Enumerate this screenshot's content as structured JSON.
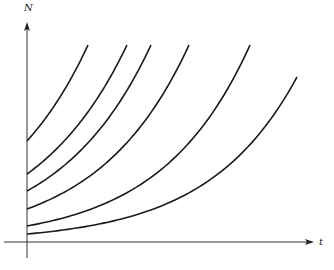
{
  "axes": {
    "y_label": "N",
    "x_label": "t",
    "origin": [
      27,
      242
    ],
    "x_end": 314,
    "y_top": 22
  },
  "chart_data": {
    "type": "line",
    "title": "",
    "xlabel": "t",
    "ylabel": "N",
    "grid": false,
    "series": [
      {
        "name": "curve-1",
        "start": [
          27,
          141
        ],
        "end": [
          88,
          45
        ]
      },
      {
        "name": "curve-2",
        "start": [
          27,
          174
        ],
        "end": [
          127,
          45
        ]
      },
      {
        "name": "curve-3",
        "start": [
          27,
          191
        ],
        "end": [
          151,
          45
        ]
      },
      {
        "name": "curve-4",
        "start": [
          27,
          209
        ],
        "end": [
          189,
          45
        ]
      },
      {
        "name": "curve-5",
        "start": [
          27,
          226
        ],
        "end": [
          250,
          45
        ]
      },
      {
        "name": "curve-6",
        "start": [
          27,
          234
        ],
        "end": [
          297,
          77
        ]
      }
    ]
  }
}
